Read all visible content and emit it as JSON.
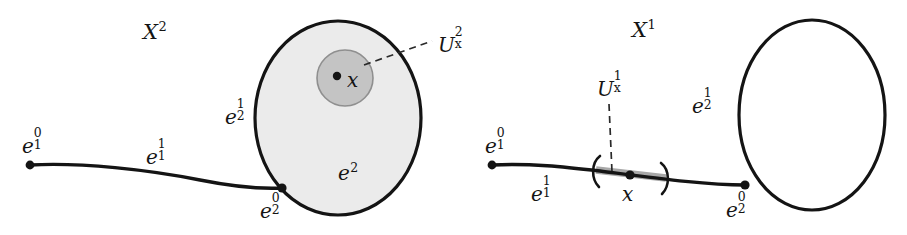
{
  "figure": {
    "title_left": "X",
    "title_right": "X",
    "background_color": "#ffffff",
    "ink_color": "#141414",
    "disk_fill_color": "#ebebeb",
    "neighborhood_fill_color": "#c4c4c4",
    "interval_highlight_color": "#a8a8a8"
  },
  "panels": [
    {
      "id": "left",
      "name": "X-squared-complex",
      "title": {
        "base": "X",
        "sup": "2",
        "sub": ""
      },
      "labels": [
        {
          "id": "e10",
          "name": "label-e-1-0",
          "base": "e",
          "sup": "0",
          "sub": "1",
          "x": 22,
          "y": 133
        },
        {
          "id": "e11",
          "name": "label-e-1-1",
          "base": "e",
          "sup": "1",
          "sub": "1",
          "x": 146,
          "y": 144
        },
        {
          "id": "e21",
          "name": "label-e-2-1",
          "base": "e",
          "sup": "1",
          "sub": "2",
          "x": 225,
          "y": 104
        },
        {
          "id": "e20",
          "name": "label-e-2-0",
          "base": "e",
          "sup": "0",
          "sub": "2",
          "x": 260,
          "y": 198
        },
        {
          "id": "e2",
          "name": "label-e-2",
          "base": "e",
          "sup": "2",
          "sub": "",
          "x": 338,
          "y": 163
        },
        {
          "id": "x",
          "name": "label-x",
          "base": "x",
          "sup": "",
          "sub": "",
          "x": 347,
          "y": 70
        },
        {
          "id": "Ux2",
          "name": "label-U-x-2",
          "base": "U",
          "sup": "2",
          "sub": "x",
          "x": 438,
          "y": 32
        }
      ]
    },
    {
      "id": "right",
      "name": "X-one-skeleton",
      "title": {
        "base": "X",
        "sup": "1",
        "sub": ""
      },
      "labels": [
        {
          "id": "e10r",
          "name": "label-e-1-0",
          "base": "e",
          "sup": "0",
          "sub": "1",
          "x": 485,
          "y": 133
        },
        {
          "id": "e11r",
          "name": "label-e-1-1",
          "base": "e",
          "sup": "1",
          "sub": "1",
          "x": 531,
          "y": 181
        },
        {
          "id": "e21r",
          "name": "label-e-2-1",
          "base": "e",
          "sup": "1",
          "sub": "2",
          "x": 692,
          "y": 93
        },
        {
          "id": "e20r",
          "name": "label-e-2-0",
          "base": "e",
          "sup": "0",
          "sub": "2",
          "x": 726,
          "y": 197
        },
        {
          "id": "xr",
          "name": "label-x",
          "base": "x",
          "sup": "",
          "sub": "",
          "x": 622,
          "y": 184
        },
        {
          "id": "Ux1",
          "name": "label-U-x-1",
          "base": "U",
          "sup": "1",
          "sub": "x",
          "x": 597,
          "y": 76
        }
      ]
    }
  ],
  "titles": {
    "left": {
      "base": "X",
      "sup": "2",
      "x": 143,
      "y": 22
    },
    "right": {
      "base": "X",
      "sup": "1",
      "x": 632,
      "y": 20
    }
  },
  "geometry": {
    "left_circle": {
      "cx": 338,
      "cy": 118,
      "rx": 83,
      "ry": 97
    },
    "left_neighborhood": {
      "cx": 345,
      "cy": 78,
      "r": 28
    },
    "left_point_x": {
      "cx": 337,
      "cy": 76
    },
    "left_vertex_e10": {
      "cx": 30,
      "cy": 165
    },
    "left_vertex_e20": {
      "cx": 282,
      "cy": 188
    },
    "right_circle": {
      "cx": 812,
      "cy": 115,
      "rx": 73,
      "ry": 95
    },
    "right_vertex_e10": {
      "cx": 492,
      "cy": 165
    },
    "right_vertex_e20": {
      "cx": 745,
      "cy": 185
    },
    "right_point_x": {
      "cx": 630,
      "cy": 175
    },
    "interval_left_paren_x": 595,
    "interval_right_paren_x": 665
  }
}
